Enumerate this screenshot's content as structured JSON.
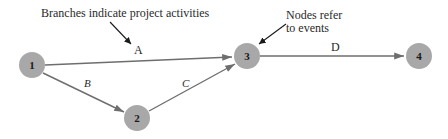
{
  "annotations": {
    "branches": "Branches indicate project activities",
    "nodes_line1": "Nodes refer",
    "nodes_line2": "to events"
  },
  "nodes": [
    {
      "id": "1",
      "label": "1"
    },
    {
      "id": "2",
      "label": "2"
    },
    {
      "id": "3",
      "label": "3"
    },
    {
      "id": "4",
      "label": "4"
    }
  ],
  "edges": [
    {
      "from": "1",
      "to": "3",
      "label": "A"
    },
    {
      "from": "1",
      "to": "2",
      "label": "B"
    },
    {
      "from": "2",
      "to": "3",
      "label": "C"
    },
    {
      "from": "3",
      "to": "4",
      "label": "D"
    }
  ],
  "colors": {
    "node_fill": "#a8a8a8",
    "edge": "#6e6e6e",
    "pointer": "#1a1a1a"
  }
}
